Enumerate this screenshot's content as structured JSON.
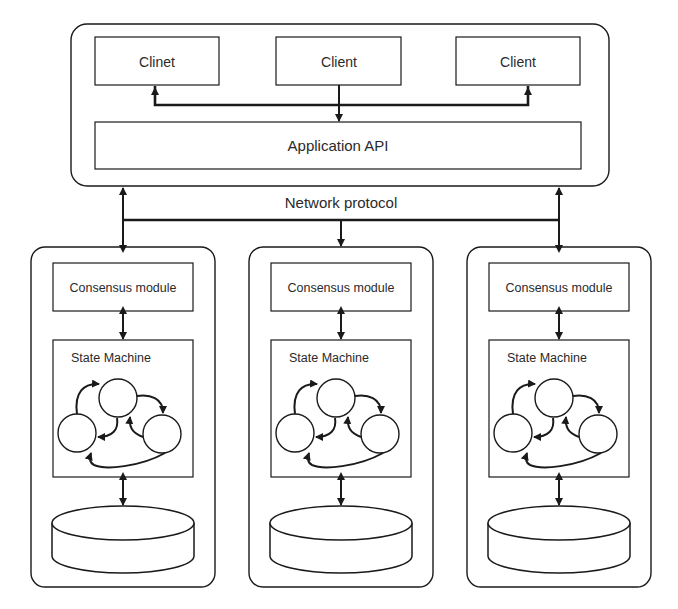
{
  "top": {
    "clients": [
      {
        "label": "Clinet"
      },
      {
        "label": "Client"
      },
      {
        "label": "Client"
      }
    ],
    "api_label": "Application API"
  },
  "network_label": "Network protocol",
  "nodes": [
    {
      "consensus_label": "Consensus module",
      "state_machine_label": "State Machine"
    },
    {
      "consensus_label": "Consensus module",
      "state_machine_label": "State Machine"
    },
    {
      "consensus_label": "Consensus module",
      "state_machine_label": "State Machine"
    }
  ],
  "colors": {
    "stroke": "#1a1a1a",
    "text": "#2a2a2a",
    "background": "#ffffff"
  }
}
